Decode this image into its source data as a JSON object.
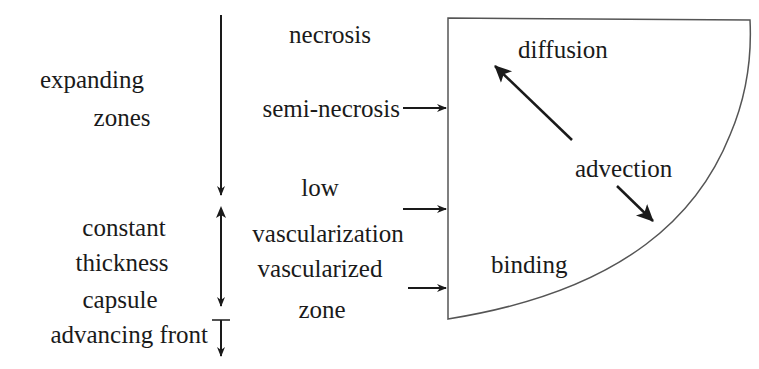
{
  "left_column": {
    "expanding_zones": [
      "expanding",
      "zones"
    ],
    "capsule": [
      "constant",
      "thickness",
      "capsule"
    ],
    "front": "advancing front"
  },
  "middle_column": {
    "necrosis": "necrosis",
    "semi_necrosis": "semi-necrosis",
    "low_vasc": [
      "low",
      "vascularization"
    ],
    "vascularized": [
      "vascularized",
      "zone"
    ]
  },
  "tumor_region": {
    "diffusion": "diffusion",
    "advection": "advection",
    "binding": "binding"
  },
  "colors": {
    "stroke": "#1a1a1a",
    "outline": "#444444",
    "background": "#ffffff"
  }
}
